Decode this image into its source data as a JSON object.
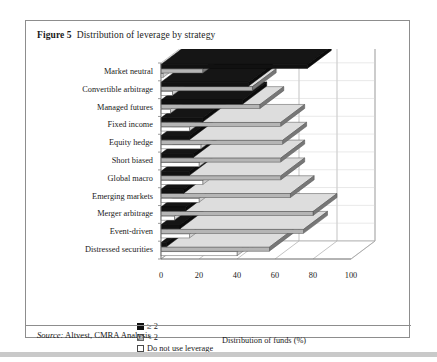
{
  "figure": {
    "number": "Figure 5",
    "caption": "Distribution of leverage by strategy",
    "source_word": "Source:",
    "source_text": " Altvest, CMRA Analysis"
  },
  "legend": {
    "items": [
      {
        "label": "≥ 2",
        "color": "#111111",
        "swatch": "black-swatch"
      },
      {
        "label": "< 2",
        "color": "#b5b5b5",
        "swatch": "gray-swatch"
      },
      {
        "label": "Do not use leverage",
        "color": "#ffffff",
        "swatch": "white-swatch"
      }
    ]
  },
  "chart_data": {
    "type": "bar",
    "orientation": "horizontal",
    "style": "3d-clustered",
    "title": "Distribution of leverage by strategy",
    "xlabel": "Distribution of funds (%)",
    "ylabel": "",
    "xlim": [
      0,
      100
    ],
    "xticks": [
      0,
      20,
      40,
      60,
      80,
      100
    ],
    "ticklabels": [
      "0",
      "20",
      "40",
      "60",
      "80",
      "100"
    ],
    "grid": true,
    "legend_position": "bottom-left",
    "categories": [
      "Market neutral",
      "Convertible arbitrage",
      "Managed futures",
      "Fixed income",
      "Equity hedge",
      "Short biased",
      "Global macro",
      "Emerging markets",
      "Merger arbitrage",
      "Event-driven",
      "Distressed securities"
    ],
    "series": [
      {
        "name": "≥ 2",
        "color": "#111111",
        "values": [
          77,
          46,
          43,
          22,
          15,
          17,
          15,
          12,
          13,
          10,
          3
        ]
      },
      {
        "name": "< 2",
        "color": "#b5b5b5",
        "values": [
          22,
          48,
          52,
          63,
          64,
          63,
          63,
          68,
          80,
          75,
          57
        ]
      },
      {
        "name": "Do not use leverage",
        "color": "#ffffff",
        "values": [
          1,
          6,
          5,
          15,
          21,
          20,
          22,
          20,
          7,
          15,
          40
        ]
      }
    ]
  }
}
